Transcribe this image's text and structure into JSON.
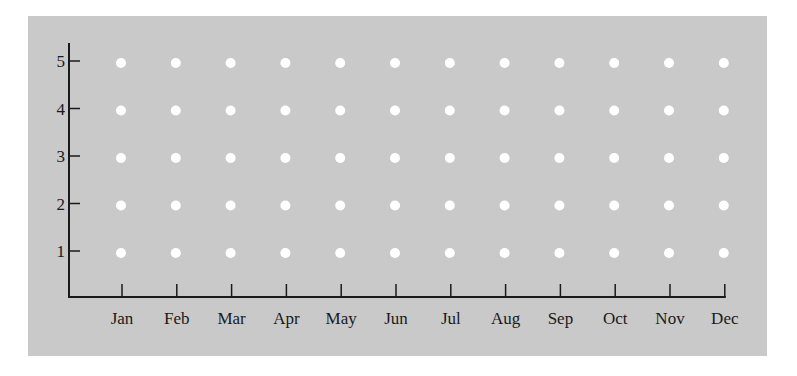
{
  "colors": {
    "background": "#ffffff",
    "panel": "#c9c9c9",
    "axis": "#1a1a1a",
    "dot": "#ffffff",
    "text": "#1a1a1a"
  },
  "chart_data": {
    "type": "scatter",
    "title": "",
    "xlabel": "",
    "ylabel": "",
    "categories": [
      "Jan",
      "Feb",
      "Mar",
      "Apr",
      "May",
      "Jun",
      "Jul",
      "Aug",
      "Sep",
      "Oct",
      "Nov",
      "Dec"
    ],
    "y_ticks": [
      1,
      2,
      3,
      4,
      5
    ],
    "ylim": [
      0,
      5.4
    ],
    "grid": false,
    "legend": null,
    "series": [
      {
        "name": "grid-dots",
        "marker": "circle",
        "color": "#ffffff",
        "points": "every category x every y_tick (1-5)",
        "values": [
          [
            1,
            2,
            3,
            4,
            5
          ],
          [
            1,
            2,
            3,
            4,
            5
          ],
          [
            1,
            2,
            3,
            4,
            5
          ],
          [
            1,
            2,
            3,
            4,
            5
          ],
          [
            1,
            2,
            3,
            4,
            5
          ],
          [
            1,
            2,
            3,
            4,
            5
          ],
          [
            1,
            2,
            3,
            4,
            5
          ],
          [
            1,
            2,
            3,
            4,
            5
          ],
          [
            1,
            2,
            3,
            4,
            5
          ],
          [
            1,
            2,
            3,
            4,
            5
          ],
          [
            1,
            2,
            3,
            4,
            5
          ],
          [
            1,
            2,
            3,
            4,
            5
          ]
        ]
      }
    ]
  }
}
